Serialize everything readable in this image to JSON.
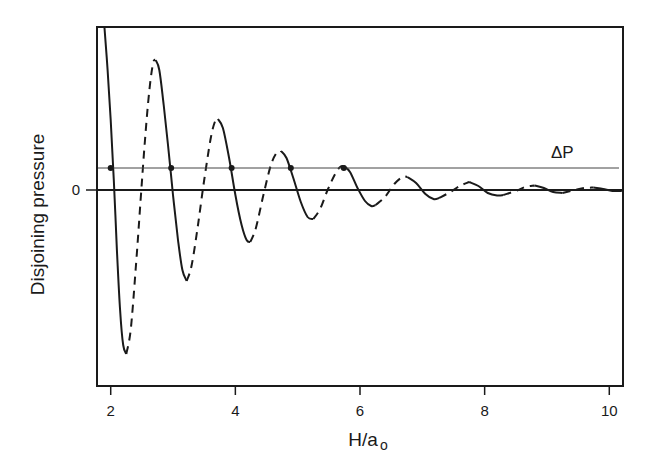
{
  "chart_data": {
    "type": "line",
    "title": "",
    "xlabel": "H/a",
    "xlabel_sub": "o",
    "ylabel": "Disjoining pressure",
    "xlim": [
      1.78,
      10.22
    ],
    "ylim": [
      -19.6,
      16.3
    ],
    "x_ticks": [
      2,
      4,
      6,
      8,
      10
    ],
    "y_ticks": [
      {
        "value": 0,
        "label": "0"
      }
    ],
    "grid": false,
    "legend": null,
    "reference_lines": [
      {
        "name": "zero",
        "y": 0,
        "style": "solid",
        "weight": "thick"
      },
      {
        "name": "delta-P",
        "y": 2.2,
        "label": "ΔP",
        "style": "solid",
        "weight": "thin"
      }
    ],
    "intersection_points": [
      {
        "x": 2.0,
        "y": 2.2
      },
      {
        "x": 2.97,
        "y": 2.2
      },
      {
        "x": 3.94,
        "y": 2.2
      },
      {
        "x": 4.89,
        "y": 2.2
      },
      {
        "x": 5.74,
        "y": 2.2
      }
    ],
    "series": [
      {
        "name": "stable-1",
        "style": "solid",
        "points": [
          [
            1.9,
            16.2
          ],
          [
            1.95,
            12
          ],
          [
            2.0,
            7
          ],
          [
            2.05,
            1
          ],
          [
            2.1,
            -6
          ],
          [
            2.15,
            -12
          ],
          [
            2.2,
            -15.5
          ],
          [
            2.25,
            -16.4
          ]
        ]
      },
      {
        "name": "unstable-1",
        "style": "dashed",
        "points": [
          [
            2.25,
            -16.4
          ],
          [
            2.32,
            -14
          ],
          [
            2.4,
            -8
          ],
          [
            2.48,
            -1
          ],
          [
            2.55,
            5
          ],
          [
            2.62,
            10
          ],
          [
            2.68,
            12.7
          ],
          [
            2.72,
            13.0
          ]
        ]
      },
      {
        "name": "stable-2",
        "style": "solid",
        "points": [
          [
            2.72,
            13.0
          ],
          [
            2.78,
            12
          ],
          [
            2.85,
            8.5
          ],
          [
            2.92,
            4.5
          ],
          [
            3.0,
            -0.5
          ],
          [
            3.08,
            -5
          ],
          [
            3.15,
            -8
          ],
          [
            3.22,
            -9.1
          ]
        ]
      },
      {
        "name": "unstable-2",
        "style": "dashed",
        "points": [
          [
            3.22,
            -9.1
          ],
          [
            3.3,
            -7.5
          ],
          [
            3.4,
            -3.5
          ],
          [
            3.5,
            1
          ],
          [
            3.6,
            5
          ],
          [
            3.67,
            6.8
          ],
          [
            3.72,
            7.1
          ]
        ]
      },
      {
        "name": "stable-3",
        "style": "solid",
        "points": [
          [
            3.72,
            7.1
          ],
          [
            3.8,
            6.2
          ],
          [
            3.9,
            3.2
          ],
          [
            4.0,
            -0.5
          ],
          [
            4.1,
            -3.5
          ],
          [
            4.18,
            -5
          ],
          [
            4.24,
            -5.2
          ]
        ]
      },
      {
        "name": "unstable-3",
        "style": "dashed",
        "points": [
          [
            4.24,
            -5.2
          ],
          [
            4.33,
            -3.8
          ],
          [
            4.45,
            -0.5
          ],
          [
            4.57,
            2.5
          ],
          [
            4.67,
            3.8
          ],
          [
            4.73,
            3.9
          ]
        ]
      },
      {
        "name": "stable-4",
        "style": "solid",
        "points": [
          [
            4.73,
            3.9
          ],
          [
            4.82,
            3.2
          ],
          [
            4.93,
            1.2
          ],
          [
            5.05,
            -1.2
          ],
          [
            5.16,
            -2.7
          ],
          [
            5.25,
            -2.9
          ]
        ]
      },
      {
        "name": "unstable-4",
        "style": "dashed",
        "points": [
          [
            5.25,
            -2.9
          ],
          [
            5.36,
            -1.9
          ],
          [
            5.48,
            0
          ],
          [
            5.6,
            1.6
          ],
          [
            5.68,
            2.3
          ],
          [
            5.74,
            2.4
          ]
        ]
      },
      {
        "name": "stable-5",
        "style": "solid",
        "points": [
          [
            5.74,
            2.4
          ],
          [
            5.84,
            1.8
          ],
          [
            5.96,
            0.2
          ],
          [
            6.08,
            -1.1
          ],
          [
            6.18,
            -1.6
          ],
          [
            6.25,
            -1.5
          ]
        ]
      },
      {
        "name": "unstable-5",
        "style": "dashed",
        "points": [
          [
            6.25,
            -1.5
          ],
          [
            6.4,
            -0.7
          ],
          [
            6.55,
            0.6
          ],
          [
            6.68,
            1.3
          ],
          [
            6.76,
            1.3
          ]
        ]
      },
      {
        "name": "stable-6",
        "style": "solid",
        "points": [
          [
            6.76,
            1.3
          ],
          [
            6.9,
            0.7
          ],
          [
            7.05,
            -0.4
          ],
          [
            7.18,
            -0.9
          ],
          [
            7.27,
            -0.8
          ]
        ]
      },
      {
        "name": "unstable-6",
        "style": "dashed",
        "points": [
          [
            7.27,
            -0.8
          ],
          [
            7.45,
            -0.2
          ],
          [
            7.6,
            0.4
          ],
          [
            7.75,
            0.8
          ]
        ]
      },
      {
        "name": "stable-7",
        "style": "solid",
        "points": [
          [
            7.75,
            0.8
          ],
          [
            7.9,
            0.4
          ],
          [
            8.05,
            -0.3
          ],
          [
            8.2,
            -0.55
          ],
          [
            8.3,
            -0.5
          ]
        ]
      },
      {
        "name": "unstable-7",
        "style": "dashed",
        "points": [
          [
            8.3,
            -0.5
          ],
          [
            8.5,
            -0.1
          ],
          [
            8.65,
            0.3
          ],
          [
            8.8,
            0.45
          ]
        ]
      },
      {
        "name": "stable-8",
        "style": "solid",
        "points": [
          [
            8.8,
            0.45
          ],
          [
            8.95,
            0.2
          ],
          [
            9.1,
            -0.2
          ],
          [
            9.25,
            -0.3
          ]
        ]
      },
      {
        "name": "unstable-8",
        "style": "dashed",
        "points": [
          [
            9.25,
            -0.3
          ],
          [
            9.45,
            0
          ],
          [
            9.6,
            0.2
          ],
          [
            9.75,
            0.25
          ]
        ]
      },
      {
        "name": "stable-9",
        "style": "solid",
        "points": [
          [
            9.75,
            0.25
          ],
          [
            9.9,
            0.1
          ],
          [
            10.05,
            -0.1
          ],
          [
            10.2,
            -0.1
          ]
        ]
      }
    ]
  }
}
